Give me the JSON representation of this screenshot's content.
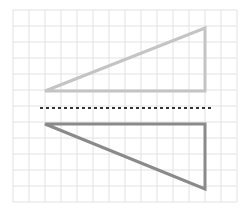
{
  "diagram": {
    "grid": {
      "x0": 13,
      "y0": 10,
      "cell": 16,
      "cols": 14,
      "rows": 12,
      "color": "#e2e2e2"
    },
    "mirror_line": {
      "x1": 40,
      "x2": 214,
      "y": 108,
      "color": "#333333",
      "style": "dashed"
    },
    "original_triangle": {
      "points": "45,91 205,91 205,28",
      "color": "#c4c4c4"
    },
    "reflected_triangle": {
      "points": "45,124 205,124 205,189",
      "color": "#8a8a8a"
    }
  }
}
